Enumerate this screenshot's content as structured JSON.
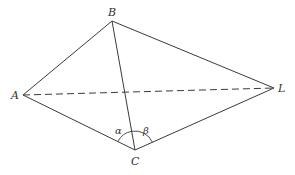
{
  "diagram": {
    "type": "geometry",
    "points": {
      "A": {
        "label": "A",
        "x": 23,
        "y": 95
      },
      "B": {
        "label": "B",
        "x": 112,
        "y": 21
      },
      "C": {
        "label": "C",
        "x": 135,
        "y": 150
      },
      "L": {
        "label": "L",
        "x": 274,
        "y": 88
      }
    },
    "edges": [
      {
        "from": "A",
        "to": "B",
        "style": "solid"
      },
      {
        "from": "B",
        "to": "L",
        "style": "solid"
      },
      {
        "from": "A",
        "to": "C",
        "style": "solid"
      },
      {
        "from": "C",
        "to": "L",
        "style": "solid"
      },
      {
        "from": "B",
        "to": "C",
        "style": "solid"
      },
      {
        "from": "A",
        "to": "L",
        "style": "dashed"
      }
    ],
    "angles": {
      "alpha": {
        "label": "α",
        "vertex": "C",
        "between": [
          "A",
          "B"
        ]
      },
      "beta": {
        "label": "β",
        "vertex": "C",
        "between": [
          "B",
          "L"
        ]
      }
    },
    "stroke_color": "#3a3a3a"
  }
}
